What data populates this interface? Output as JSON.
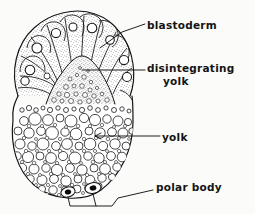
{
  "figure": {
    "kind": "biological-diagram",
    "background_color": "#fbfbfa",
    "ink_color": "#141414",
    "labels": [
      {
        "id": "blastoderm",
        "text": "blastoderm",
        "lines": [
          "blastoderm"
        ]
      },
      {
        "id": "disintegrating_yolk",
        "text": "disintegrating yolk",
        "lines": [
          "disintegrating",
          "yolk"
        ]
      },
      {
        "id": "yolk",
        "text": "yolk",
        "lines": [
          "yolk"
        ]
      },
      {
        "id": "polar_body",
        "text": "polar body",
        "lines": [
          "polar body"
        ]
      }
    ],
    "structures": [
      {
        "name": "blastoderm",
        "description": "cap of wedge-shaped stippled cells each containing a round nucleus, covering the upper pole"
      },
      {
        "name": "disintegrating yolk",
        "description": "stippled dome of small breaking-down yolk granules beneath the blastoderm"
      },
      {
        "name": "yolk",
        "description": "mass of densely packed round yolk spheres of varying size filling the lower body"
      },
      {
        "name": "polar body",
        "description": "two small dark oval bodies at the vegetal pole of the egg"
      }
    ],
    "leaders": [
      {
        "for": "blastoderm",
        "style": "line from a blastoderm cell up-right to label"
      },
      {
        "for": "disintegrating_yolk",
        "style": "horizontal line from the central stippled dome to label"
      },
      {
        "for": "yolk",
        "style": "horizontal line with arrowhead pointing left into a yolk sphere"
      },
      {
        "for": "polar_body",
        "style": "bracket joining both polar bodies then rising right to label"
      }
    ]
  }
}
